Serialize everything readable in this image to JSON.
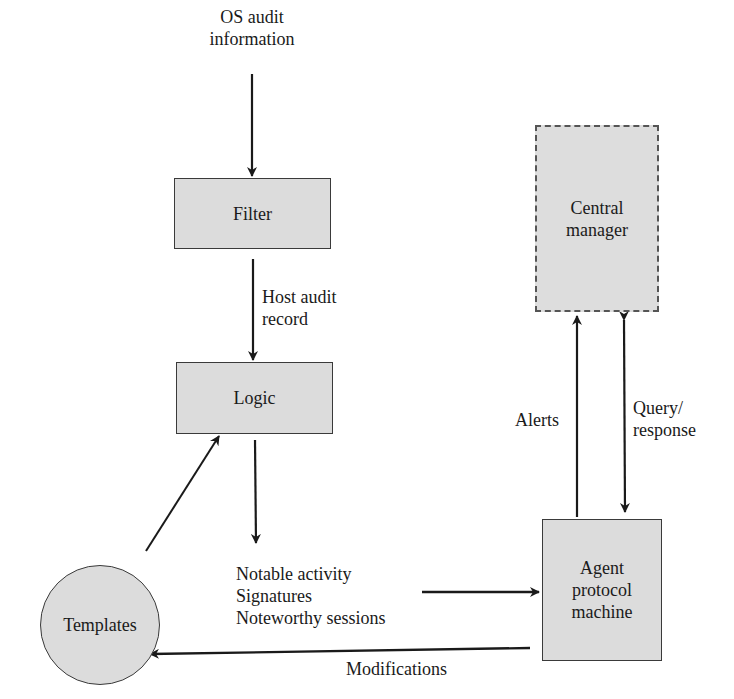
{
  "diagram": {
    "type": "host agent intrusion detection architecture",
    "nodes": {
      "filter": {
        "label": "Filter"
      },
      "logic": {
        "label": "Logic"
      },
      "templates": {
        "label": "Templates"
      },
      "central_manager": {
        "line1": "Central",
        "line2": "manager"
      },
      "agent": {
        "line1": "Agent",
        "line2": "protocol",
        "line3": "machine"
      }
    },
    "labels": {
      "os_audit": {
        "line1": "OS audit",
        "line2": "information"
      },
      "host_audit": {
        "line1": "Host audit",
        "line2": "record"
      },
      "alerts": "Alerts",
      "query": {
        "line1": "Query/",
        "line2": "response"
      },
      "notable": {
        "line1": "Notable activity",
        "line2": "Signatures",
        "line3": "Noteworthy sessions"
      },
      "modifications": "Modifications"
    },
    "edges": [
      {
        "from": "OS audit information",
        "to": "Filter"
      },
      {
        "from": "Filter",
        "to": "Logic",
        "label": "Host audit record"
      },
      {
        "from": "Templates",
        "to": "Logic"
      },
      {
        "from": "Logic",
        "to": "Notable activity / Signatures / Noteworthy sessions"
      },
      {
        "from": "Notable activity / Signatures / Noteworthy sessions",
        "to": "Agent protocol machine"
      },
      {
        "from": "Agent protocol machine",
        "to": "Central manager",
        "label": "Alerts"
      },
      {
        "from": "Central manager",
        "to": "Agent protocol machine",
        "label": "Query/response",
        "bidirectional": true
      },
      {
        "from": "Agent protocol machine",
        "to": "Templates",
        "label": "Modifications"
      }
    ],
    "colors": {
      "fill": "#dcdcdc",
      "stroke": "#1a1a1a"
    }
  }
}
